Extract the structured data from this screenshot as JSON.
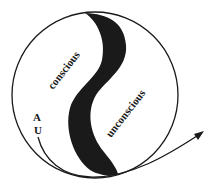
{
  "diagram": {
    "labels": {
      "conscious": "conscious",
      "unconscious": "unconscious",
      "a": "A",
      "u": "U"
    },
    "colors": {
      "stroke": "#1a1a1a",
      "band": "#1a1a1a",
      "background": "#ffffff"
    }
  }
}
